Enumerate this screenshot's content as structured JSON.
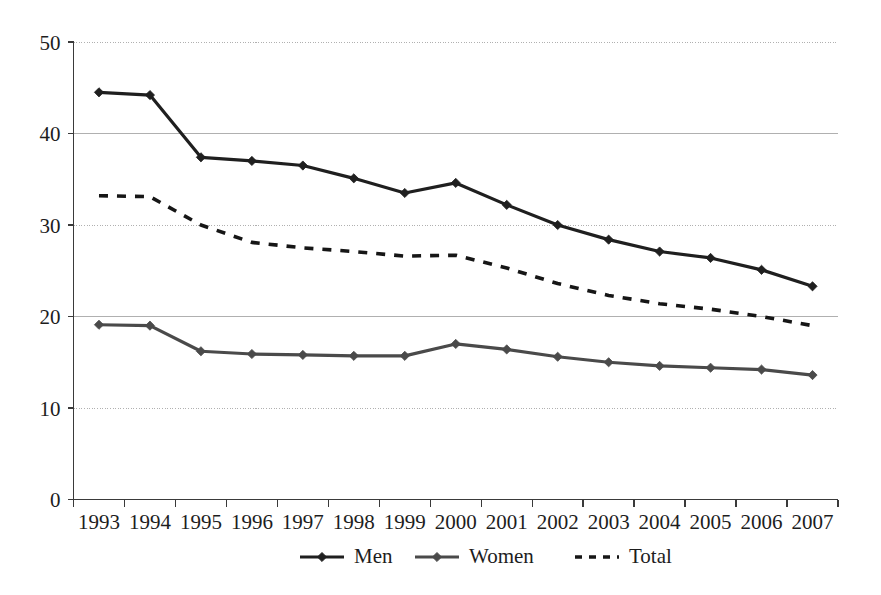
{
  "chart_data": {
    "type": "line",
    "title": "",
    "subtitle": "",
    "xlabel": "",
    "ylabel": "",
    "categories": [
      "1993",
      "1994",
      "1995",
      "1996",
      "1997",
      "1998",
      "1999",
      "2000",
      "2001",
      "2002",
      "2003",
      "2004",
      "2005",
      "2006",
      "2007"
    ],
    "ylim": [
      0,
      50
    ],
    "yticks": [
      0,
      10,
      20,
      30,
      40,
      50
    ],
    "ytick_labels": [
      "0",
      "10",
      "20",
      "30",
      "40",
      "50"
    ],
    "grid": "horizontal",
    "legend_position": "bottom",
    "series": [
      {
        "name": "Men",
        "style": "solid",
        "marker": "diamond",
        "color": "#1f1f1f",
        "values": [
          44.5,
          44.2,
          37.4,
          37.0,
          36.5,
          35.1,
          33.5,
          34.6,
          32.2,
          30.0,
          28.4,
          27.1,
          26.4,
          25.1,
          23.3
        ]
      },
      {
        "name": "Women",
        "style": "solid",
        "marker": "diamond",
        "color": "#4a4a4a",
        "values": [
          19.1,
          19.0,
          16.2,
          15.9,
          15.8,
          15.7,
          15.7,
          17.0,
          16.4,
          15.6,
          15.0,
          14.6,
          14.4,
          14.2,
          13.6
        ]
      },
      {
        "name": "Total",
        "style": "dashed",
        "marker": "none",
        "color": "#161616",
        "values": [
          33.2,
          33.1,
          30.0,
          28.1,
          27.5,
          27.1,
          26.6,
          26.7,
          25.3,
          23.6,
          22.3,
          21.4,
          20.8,
          20.0,
          19.0
        ]
      }
    ]
  },
  "legend": {
    "items": [
      {
        "label": "Men"
      },
      {
        "label": "Women"
      },
      {
        "label": "Total"
      }
    ]
  },
  "axes": {
    "y_tick_labels": [
      "50",
      "40",
      "30",
      "20",
      "10",
      "0"
    ],
    "x_tick_labels": [
      "1993",
      "1994",
      "1995",
      "1996",
      "1997",
      "1998",
      "1999",
      "2000",
      "2001",
      "2002",
      "2003",
      "2004",
      "2005",
      "2006",
      "2007"
    ]
  },
  "colors": {
    "men": "#1f1f1f",
    "women": "#4a4a4a",
    "total": "#161616",
    "axis": "#3a3a3a",
    "gridline": "#b0b0b0",
    "background": "#ffffff"
  }
}
